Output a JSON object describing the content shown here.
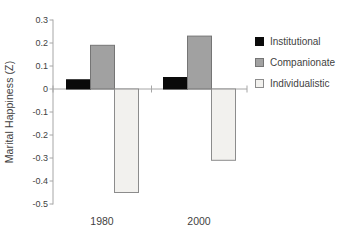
{
  "figure": {
    "background": "#ffffff",
    "axis_color": "#a6a6a6",
    "text_color": "#3f3f3f"
  },
  "chart_data": {
    "type": "bar",
    "title": "",
    "xlabel": "",
    "ylabel": "Marital Happiness (Z)",
    "categories": [
      "1980",
      "2000"
    ],
    "series": [
      {
        "name": "Institutional",
        "values": [
          0.04,
          0.05
        ],
        "fill": "#0a0a0a",
        "stroke": "#0a0a0a"
      },
      {
        "name": "Companionate",
        "values": [
          0.19,
          0.23
        ],
        "fill": "#a1a1a1",
        "stroke": "#757575"
      },
      {
        "name": "Individualistic",
        "values": [
          -0.45,
          -0.31
        ],
        "fill": "#f2f1ee",
        "stroke": "#8c8c8c"
      }
    ],
    "ylim": [
      -0.5,
      0.3
    ],
    "ytick_step": 0.1,
    "yticks": [
      0.3,
      0.2,
      0.1,
      0,
      -0.1,
      -0.2,
      -0.3,
      -0.4,
      -0.5
    ],
    "grid": false,
    "legend_position": "right"
  }
}
